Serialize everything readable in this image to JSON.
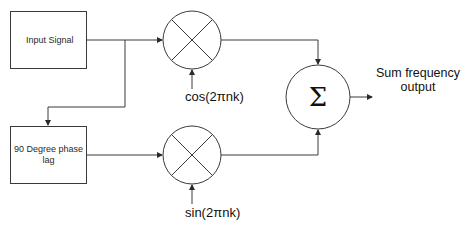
{
  "diagram": {
    "type": "signal-flow block diagram",
    "blocks": {
      "input_signal": {
        "label": "Input Signal"
      },
      "phase_lag": {
        "label_line1": "90 Degree phase",
        "label_line2": "lag"
      }
    },
    "multipliers": {
      "top": {
        "symbol": "×",
        "carrier_label": "cos(2πnk)"
      },
      "bottom": {
        "symbol": "×",
        "carrier_label": "sin(2πnk)"
      }
    },
    "summer": {
      "symbol": "Σ"
    },
    "output": {
      "label_line1": "Sum frequency",
      "label_line2": "output"
    },
    "colors": {
      "line": "#3a3a3a",
      "text": "#111111",
      "background": "#ffffff"
    }
  }
}
